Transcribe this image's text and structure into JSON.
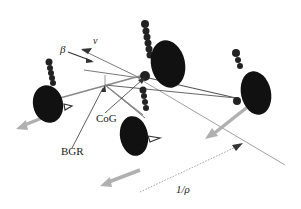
{
  "diagram": {
    "labels": {
      "sideslip": "β",
      "velocity": "v",
      "cog": "CoG",
      "bgr": "BGR",
      "radius": "1/ρ"
    },
    "nodes": [
      {
        "id": "wheel-front-left",
        "label": ""
      },
      {
        "id": "wheel-front-right",
        "label": ""
      },
      {
        "id": "wheel-rear-left",
        "label": ""
      },
      {
        "id": "wheel-rear-right",
        "label": ""
      },
      {
        "id": "center-of-gravity",
        "label": "CoG"
      },
      {
        "id": "bgr-point",
        "label": "BGR"
      }
    ],
    "colors": {
      "wheel": "#111111",
      "link": "#555555",
      "arrow": "#9a9a9a",
      "text": "#222222"
    }
  }
}
